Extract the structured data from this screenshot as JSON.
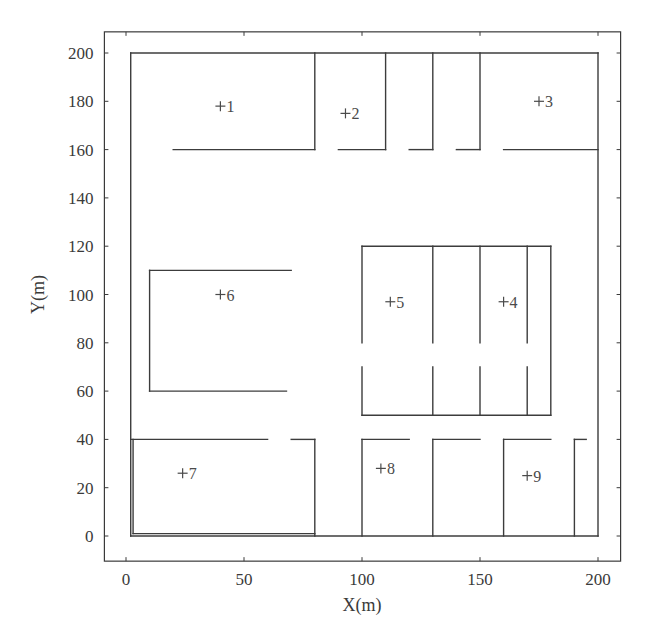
{
  "chart_data": {
    "type": "line",
    "title": "",
    "xlabel": "X(m)",
    "ylabel": "Y(m)",
    "xlim": [
      -10,
      210
    ],
    "ylim": [
      -10,
      210
    ],
    "x_ticks": [
      0,
      50,
      100,
      150,
      200
    ],
    "y_ticks": [
      0,
      20,
      40,
      60,
      80,
      100,
      120,
      140,
      160,
      180,
      200
    ],
    "grid": false,
    "legend": null,
    "wall_color": "#3c3c3c",
    "walls": [
      {
        "name": "outer-top",
        "x1": 2,
        "y1": 200,
        "x2": 200,
        "y2": 200
      },
      {
        "name": "outer-left",
        "x1": 2,
        "y1": 200,
        "x2": 2,
        "y2": 0
      },
      {
        "name": "outer-right",
        "x1": 200,
        "y1": 200,
        "x2": 200,
        "y2": 0
      },
      {
        "name": "outer-bottom",
        "x1": 2,
        "y1": 0,
        "x2": 200,
        "y2": 0
      },
      {
        "name": "room1-bottom",
        "x1": 20,
        "y1": 160,
        "x2": 80,
        "y2": 160
      },
      {
        "name": "room1-right",
        "x1": 80,
        "y1": 200,
        "x2": 80,
        "y2": 160
      },
      {
        "name": "room2-bottom",
        "x1": 90,
        "y1": 160,
        "x2": 110,
        "y2": 160
      },
      {
        "name": "room2-right",
        "x1": 110,
        "y1": 200,
        "x2": 110,
        "y2": 160
      },
      {
        "name": "room-a-bottom",
        "x1": 120,
        "y1": 160,
        "x2": 130,
        "y2": 160
      },
      {
        "name": "room-a-right",
        "x1": 130,
        "y1": 200,
        "x2": 130,
        "y2": 160
      },
      {
        "name": "room-b-bottom",
        "x1": 140,
        "y1": 160,
        "x2": 150,
        "y2": 160
      },
      {
        "name": "room-b-right",
        "x1": 150,
        "y1": 200,
        "x2": 150,
        "y2": 160
      },
      {
        "name": "room3-bottom",
        "x1": 160,
        "y1": 160,
        "x2": 200,
        "y2": 160
      },
      {
        "name": "room6-top",
        "x1": 10,
        "y1": 110,
        "x2": 70,
        "y2": 110
      },
      {
        "name": "room6-left",
        "x1": 10,
        "y1": 110,
        "x2": 10,
        "y2": 60
      },
      {
        "name": "room6-bottom",
        "x1": 10,
        "y1": 60,
        "x2": 68,
        "y2": 60
      },
      {
        "name": "block-top",
        "x1": 100,
        "y1": 120,
        "x2": 180,
        "y2": 120
      },
      {
        "name": "block-bottom",
        "x1": 100,
        "y1": 50,
        "x2": 180,
        "y2": 50
      },
      {
        "name": "block-right",
        "x1": 180,
        "y1": 120,
        "x2": 180,
        "y2": 50
      },
      {
        "name": "block-x100-upper",
        "x1": 100,
        "y1": 120,
        "x2": 100,
        "y2": 80
      },
      {
        "name": "block-x100-lower",
        "x1": 100,
        "y1": 70,
        "x2": 100,
        "y2": 50
      },
      {
        "name": "block-x130-upper",
        "x1": 130,
        "y1": 120,
        "x2": 130,
        "y2": 80
      },
      {
        "name": "block-x130-lower",
        "x1": 130,
        "y1": 70,
        "x2": 130,
        "y2": 50
      },
      {
        "name": "block-x150-upper",
        "x1": 150,
        "y1": 120,
        "x2": 150,
        "y2": 80
      },
      {
        "name": "block-x150-lower",
        "x1": 150,
        "y1": 70,
        "x2": 150,
        "y2": 50
      },
      {
        "name": "block-x170-upper",
        "x1": 170,
        "y1": 120,
        "x2": 170,
        "y2": 80
      },
      {
        "name": "block-x170-lower",
        "x1": 170,
        "y1": 70,
        "x2": 170,
        "y2": 50
      },
      {
        "name": "room7-top-left",
        "x1": 2,
        "y1": 40,
        "x2": 60,
        "y2": 40
      },
      {
        "name": "room7-top-right",
        "x1": 70,
        "y1": 40,
        "x2": 80,
        "y2": 40
      },
      {
        "name": "room7-right",
        "x1": 80,
        "y1": 40,
        "x2": 80,
        "y2": 0
      },
      {
        "name": "room7-left-inner",
        "x1": 3,
        "y1": 40,
        "x2": 3,
        "y2": 1
      },
      {
        "name": "room7-bottom-inner",
        "x1": 3,
        "y1": 1,
        "x2": 80,
        "y2": 1
      },
      {
        "name": "room8-top",
        "x1": 100,
        "y1": 40,
        "x2": 120,
        "y2": 40
      },
      {
        "name": "room8-left",
        "x1": 100,
        "y1": 40,
        "x2": 100,
        "y2": 0
      },
      {
        "name": "room-c-top",
        "x1": 130,
        "y1": 40,
        "x2": 150,
        "y2": 40
      },
      {
        "name": "room-c-left",
        "x1": 130,
        "y1": 40,
        "x2": 130,
        "y2": 0
      },
      {
        "name": "room9-top",
        "x1": 160,
        "y1": 40,
        "x2": 180,
        "y2": 40
      },
      {
        "name": "room9-left",
        "x1": 160,
        "y1": 40,
        "x2": 160,
        "y2": 0
      },
      {
        "name": "room-d-top",
        "x1": 190,
        "y1": 40,
        "x2": 195,
        "y2": 40
      },
      {
        "name": "room-d-left",
        "x1": 190,
        "y1": 40,
        "x2": 190,
        "y2": 0
      }
    ],
    "points": [
      {
        "label": "1",
        "x": 40,
        "y": 178
      },
      {
        "label": "2",
        "x": 93,
        "y": 175
      },
      {
        "label": "3",
        "x": 175,
        "y": 180
      },
      {
        "label": "4",
        "x": 160,
        "y": 97
      },
      {
        "label": "5",
        "x": 112,
        "y": 97
      },
      {
        "label": "6",
        "x": 40,
        "y": 100
      },
      {
        "label": "7",
        "x": 24,
        "y": 26
      },
      {
        "label": "8",
        "x": 108,
        "y": 28
      },
      {
        "label": "9",
        "x": 170,
        "y": 25
      }
    ]
  }
}
